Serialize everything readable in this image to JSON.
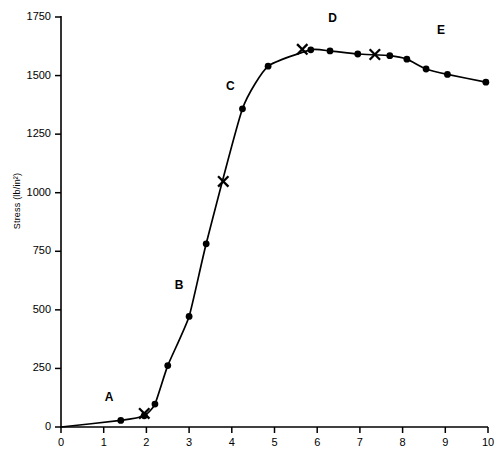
{
  "chart_data": {
    "type": "line",
    "title": "",
    "xlabel": "",
    "ylabel": "Stress  (lb/in²)",
    "xlim": [
      0,
      10
    ],
    "ylim": [
      0,
      1750
    ],
    "grid": false,
    "legend": null,
    "x_ticks": [
      "0",
      "1",
      "2",
      "3",
      "4",
      "5",
      "6",
      "7",
      "8",
      "9",
      "10"
    ],
    "x_tick_values": [
      0,
      1,
      2,
      3,
      4,
      5,
      6,
      7,
      8,
      9,
      10
    ],
    "y_ticks": [
      "0",
      "250",
      "500",
      "750",
      "1000",
      "1250",
      "1500",
      "1750"
    ],
    "y_tick_values": [
      0,
      250,
      500,
      750,
      1000,
      1250,
      1500,
      1750
    ],
    "series": [
      {
        "name": "stress-strain",
        "marker": "circle",
        "color": "#000000",
        "points": [
          {
            "x": 1.4,
            "y": 28
          },
          {
            "x": 1.95,
            "y": 48
          },
          {
            "x": 2.2,
            "y": 98
          },
          {
            "x": 2.5,
            "y": 262
          },
          {
            "x": 3.0,
            "y": 472
          },
          {
            "x": 3.4,
            "y": 782
          },
          {
            "x": 4.25,
            "y": 1358
          },
          {
            "x": 4.85,
            "y": 1540
          },
          {
            "x": 5.85,
            "y": 1610
          },
          {
            "x": 6.3,
            "y": 1605
          },
          {
            "x": 6.95,
            "y": 1592
          },
          {
            "x": 7.7,
            "y": 1585
          },
          {
            "x": 8.1,
            "y": 1570
          },
          {
            "x": 8.55,
            "y": 1528
          },
          {
            "x": 9.05,
            "y": 1505
          },
          {
            "x": 9.95,
            "y": 1472
          }
        ]
      }
    ],
    "x_markers": [
      {
        "x": 1.95,
        "y": 58,
        "label": "proportional-limit"
      },
      {
        "x": 3.8,
        "y": 1048,
        "label": "yield-point"
      },
      {
        "x": 5.65,
        "y": 1612,
        "label": "ultimate-strength"
      },
      {
        "x": 7.35,
        "y": 1590,
        "label": "fracture-onset"
      }
    ],
    "annotations": [
      {
        "text": "A",
        "x": 1.12,
        "y": 122
      },
      {
        "text": "B",
        "x": 2.76,
        "y": 600
      },
      {
        "text": "C",
        "x": 3.96,
        "y": 1452
      },
      {
        "text": "D",
        "x": 6.35,
        "y": 1742
      },
      {
        "text": "E",
        "x": 8.9,
        "y": 1690
      }
    ]
  }
}
